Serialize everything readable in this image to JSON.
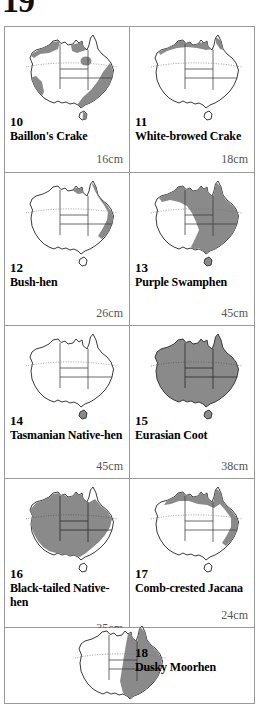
{
  "page": {
    "heading_partial": "19",
    "colors": {
      "range_fill": "#8a8a8a",
      "land_fill": "#ffffff",
      "outline": "#3a3a3a",
      "border_line": "#9a9a9a",
      "size_text": "#555555"
    }
  },
  "entries": [
    {
      "number": "10",
      "name": "Baillon's Crake",
      "size": "16cm",
      "map": {
        "name": "australia-range-map",
        "shading": "coastal-south-west-south-east-north"
      }
    },
    {
      "number": "11",
      "name": "White-browed Crake",
      "size": "18cm",
      "map": {
        "name": "australia-range-map",
        "shading": "north-coast-only"
      }
    },
    {
      "number": "12",
      "name": "Bush-hen",
      "size": "26cm",
      "map": {
        "name": "australia-range-map",
        "shading": "east-coast-strip"
      }
    },
    {
      "number": "13",
      "name": "Purple Swamphen",
      "size": "45cm",
      "map": {
        "name": "australia-range-map",
        "shading": "north-and-east-and-south-east"
      }
    },
    {
      "number": "14",
      "name": "Tasmanian Native-hen",
      "size": "45cm",
      "map": {
        "name": "australia-range-map",
        "shading": "tasmania-only"
      }
    },
    {
      "number": "15",
      "name": "Eurasian Coot",
      "size": "38cm",
      "map": {
        "name": "australia-range-map",
        "shading": "whole-continent"
      }
    },
    {
      "number": "16",
      "name": "Black-tailed Native-hen",
      "size": "35cm",
      "map": {
        "name": "australia-range-map",
        "shading": "most-of-continent-except-coasts"
      }
    },
    {
      "number": "17",
      "name": "Comb-crested Jacana",
      "size": "24cm",
      "map": {
        "name": "australia-range-map",
        "shading": "north-and-north-east-coast"
      }
    },
    {
      "number": "18",
      "name": "Dusky Moorhen",
      "size": "",
      "map": {
        "name": "australia-range-map",
        "shading": "east-half"
      }
    }
  ]
}
